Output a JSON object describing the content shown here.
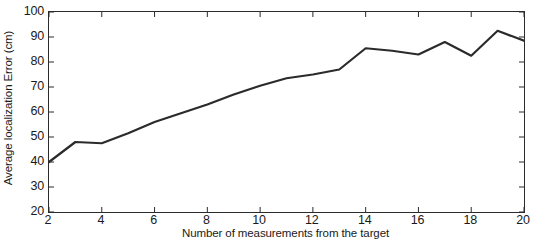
{
  "chart_data": {
    "type": "line",
    "title": "",
    "xlabel": "Number of measurements from the target",
    "ylabel": "Average localization Error (cm)",
    "x": [
      2,
      3,
      4,
      5,
      6,
      7,
      8,
      9,
      10,
      11,
      12,
      13,
      14,
      15,
      16,
      17,
      18,
      19,
      20
    ],
    "values": [
      40,
      48,
      47.5,
      51.5,
      56,
      59.5,
      63,
      67,
      70.5,
      73.5,
      75,
      77,
      85.5,
      84.5,
      83,
      88,
      82.5,
      92.5,
      88.5
    ],
    "series": [
      {
        "name": "Average localization Error",
        "color": "#2b2b2b",
        "values": [
          40,
          48,
          47.5,
          51.5,
          56,
          59.5,
          63,
          67,
          70.5,
          73.5,
          75,
          77,
          85.5,
          84.5,
          83,
          88,
          82.5,
          92.5,
          88.5
        ]
      }
    ],
    "xlim": [
      2,
      20
    ],
    "ylim": [
      20,
      100
    ],
    "xticks": [
      "2",
      "4",
      "6",
      "8",
      "10",
      "12",
      "14",
      "16",
      "18",
      "20"
    ],
    "xtick_values": [
      2,
      4,
      6,
      8,
      10,
      12,
      14,
      16,
      18,
      20
    ],
    "yticks": [
      "20",
      "30",
      "40",
      "50",
      "60",
      "70",
      "80",
      "90",
      "100"
    ],
    "ytick_values": [
      20,
      30,
      40,
      50,
      60,
      70,
      80,
      90,
      100
    ],
    "grid": false,
    "legend": null,
    "line_color": "#2b2b2b",
    "line_width": 2.2,
    "background": "#ffffff",
    "axis_color": "#2b2b2b"
  }
}
